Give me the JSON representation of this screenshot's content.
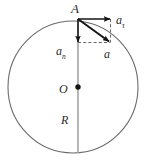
{
  "figure": {
    "type": "physics-diagram",
    "colors": {
      "circle_stroke": "#6b6b6b",
      "radius_line": "#9a9a9a",
      "vector_stroke": "#1a1a1a",
      "dashed_stroke": "#555555",
      "label_color": "#2b2b2b",
      "background": "#ffffff"
    },
    "geometry": {
      "center_x": 73,
      "center_y": 87,
      "radius_x": 65,
      "radius_y": 66,
      "point_a_x": 78,
      "point_a_y": 19,
      "tangential_tip_x": 111,
      "tangential_tip_y": 19,
      "normal_tip_x": 78,
      "normal_tip_y": 43,
      "resultant_tip_x": 110,
      "resultant_tip_y": 42
    },
    "labels": {
      "point_a": "A",
      "tangential_base": "a",
      "tangential_sub": "τ",
      "normal_base": "a",
      "normal_sub": "n",
      "resultant": "a",
      "center": "O",
      "radius": "R"
    },
    "elements": {
      "circle_name": "circle-outline",
      "center_dot_name": "center-point-dot",
      "radius_line_name": "vertical-diameter-line",
      "tangential_vector_name": "tangential-acceleration-vector",
      "normal_vector_name": "normal-acceleration-vector",
      "resultant_vector_name": "resultant-acceleration-vector",
      "dashed_horizontal_name": "dashed-horizontal-construction-line",
      "dashed_vertical_name": "dashed-vertical-construction-line"
    }
  }
}
